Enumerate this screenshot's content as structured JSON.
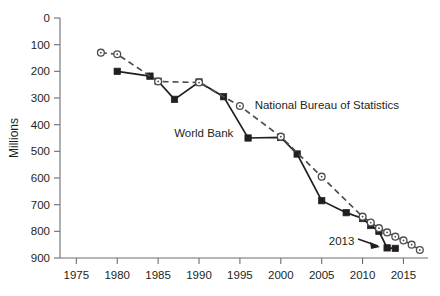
{
  "chart_data": {
    "type": "line",
    "title": "",
    "subtitle": "",
    "xlabel": "",
    "ylabel": "Millions",
    "xlim": [
      1973,
      2018
    ],
    "ylim": [
      0,
      900
    ],
    "grid": false,
    "legend_position": "inline-annotations",
    "xticks": [
      1975,
      1980,
      1985,
      1990,
      1995,
      2000,
      2005,
      2010,
      2015
    ],
    "yticks": [
      0,
      100,
      200,
      300,
      400,
      500,
      600,
      700,
      800,
      900
    ],
    "series": [
      {
        "name": "World Bank",
        "marker": "filled-square",
        "line": "solid",
        "color": "#231f20",
        "points": [
          {
            "x": 1980,
            "y": 700
          },
          {
            "x": 1984,
            "y": 682
          },
          {
            "x": 1985,
            "y": 663
          },
          {
            "x": 1987,
            "y": 595
          },
          {
            "x": 1990,
            "y": 660
          },
          {
            "x": 1993,
            "y": 605
          },
          {
            "x": 1996,
            "y": 450
          },
          {
            "x": 2000,
            "y": 452
          },
          {
            "x": 2002,
            "y": 390
          },
          {
            "x": 2005,
            "y": 215
          },
          {
            "x": 2008,
            "y": 170
          },
          {
            "x": 2010,
            "y": 148
          },
          {
            "x": 2011,
            "y": 122
          },
          {
            "x": 2012,
            "y": 100
          },
          {
            "x": 2013,
            "y": 38
          },
          {
            "x": 2014,
            "y": 36
          }
        ]
      },
      {
        "name": "National Bureau of Statistics",
        "marker": "open-circle",
        "line": "dashed",
        "color": "#4d4d4f",
        "points": [
          {
            "x": 1978,
            "y": 770
          },
          {
            "x": 1980,
            "y": 764
          },
          {
            "x": 1985,
            "y": 662
          },
          {
            "x": 1990,
            "y": 658
          },
          {
            "x": 1995,
            "y": 570
          },
          {
            "x": 2000,
            "y": 455
          },
          {
            "x": 2005,
            "y": 305
          },
          {
            "x": 2010,
            "y": 155
          },
          {
            "x": 2011,
            "y": 133
          },
          {
            "x": 2012,
            "y": 112
          },
          {
            "x": 2013,
            "y": 96
          },
          {
            "x": 2014,
            "y": 80
          },
          {
            "x": 2015,
            "y": 66
          },
          {
            "x": 2016,
            "y": 50
          },
          {
            "x": 2017,
            "y": 30
          }
        ]
      }
    ],
    "annotations": [
      {
        "name": "world-bank-label",
        "text": "World Bank",
        "x": 1994.2,
        "y": 455,
        "anchor": "end"
      },
      {
        "name": "nbs-label",
        "text": "National Bureau of Statistics",
        "x": 1996.8,
        "y": 560,
        "anchor": "start"
      },
      {
        "name": "year-2013-callout",
        "text": "2013",
        "x": 2009.0,
        "y": 48,
        "anchor": "end"
      }
    ]
  },
  "axis": {
    "ylabel": "Millions",
    "ytick_labels": [
      "900",
      "800",
      "700",
      "600",
      "500",
      "400",
      "300",
      "200",
      "100",
      "0"
    ],
    "xtick_labels": [
      "1975",
      "1980",
      "1985",
      "1990",
      "1995",
      "2000",
      "2005",
      "2010",
      "2015"
    ]
  },
  "labels": {
    "world_bank": "World Bank",
    "national_bureau": "National Bureau of Statistics",
    "year_callout": "2013"
  }
}
